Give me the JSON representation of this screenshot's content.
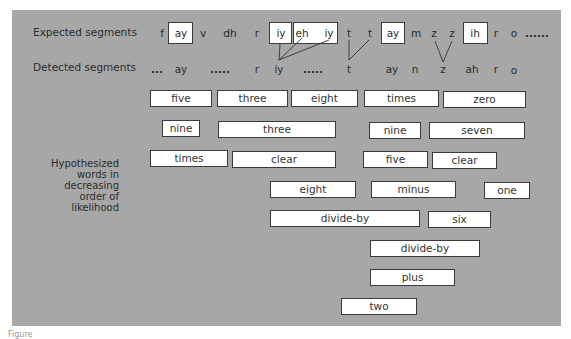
{
  "labels": {
    "expected": "Expected segments",
    "detected": "Detected segments",
    "hypothesized": "Hypothesized words in decreasing order of likelihood"
  },
  "expected_segments": [
    {
      "text": "f",
      "boxed": false
    },
    {
      "text": "ay",
      "boxed": true
    },
    {
      "text": "v",
      "boxed": false
    },
    {
      "text": "dh",
      "boxed": false
    },
    {
      "text": "r",
      "boxed": false
    },
    {
      "text": "iy",
      "boxed": true
    },
    {
      "text": "eh",
      "boxed": true
    },
    {
      "text": "iy",
      "boxed": true
    },
    {
      "text": "t",
      "boxed": false
    },
    {
      "text": "t",
      "boxed": false
    },
    {
      "text": "ay",
      "boxed": true
    },
    {
      "text": "m",
      "boxed": false
    },
    {
      "text": "z",
      "boxed": false
    },
    {
      "text": "z",
      "boxed": false
    },
    {
      "text": "ih",
      "boxed": true
    },
    {
      "text": "r",
      "boxed": false
    },
    {
      "text": "o",
      "boxed": false
    },
    {
      "text": "......",
      "boxed": false
    }
  ],
  "detected_segments": [
    {
      "text": "..."
    },
    {
      "text": "ay"
    },
    {
      "text": "....."
    },
    {
      "text": "r"
    },
    {
      "text": "iy"
    },
    {
      "text": "....."
    },
    {
      "text": "t"
    },
    {
      "text": "ay"
    },
    {
      "text": "n"
    },
    {
      "text": "z"
    },
    {
      "text": "ah"
    },
    {
      "text": "r"
    },
    {
      "text": "o"
    }
  ],
  "hypothesized_words": [
    [
      "five",
      "three",
      "eight",
      "times",
      "zero"
    ],
    [
      "nine",
      "three",
      "nine",
      "seven"
    ],
    [
      "times",
      "clear",
      "five",
      "clear"
    ],
    [
      "eight",
      "minus",
      "one"
    ],
    [
      "divide-by",
      "six"
    ],
    [
      "divide-by"
    ],
    [
      "plus"
    ],
    [
      "two"
    ]
  ],
  "caption": "Figure"
}
